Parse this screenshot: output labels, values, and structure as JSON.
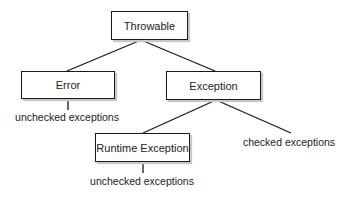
{
  "diagram": {
    "type": "class-hierarchy-tree",
    "nodes": [
      {
        "id": "throwable",
        "label": "Throwable"
      },
      {
        "id": "error",
        "label": "Error"
      },
      {
        "id": "exception",
        "label": "Exception"
      },
      {
        "id": "runtime",
        "label": "Runtime Exception"
      }
    ],
    "edges": [
      {
        "from": "throwable",
        "to": "error"
      },
      {
        "from": "throwable",
        "to": "exception"
      },
      {
        "from": "exception",
        "to": "runtime"
      },
      {
        "from": "exception",
        "to": "checked_label"
      },
      {
        "from": "error",
        "to": "error_unchecked_label"
      },
      {
        "from": "runtime",
        "to": "runtime_unchecked_label"
      }
    ],
    "annotations": {
      "error_unchecked": "unchecked exceptions",
      "checked": "checked exceptions",
      "runtime_unchecked": "unchecked exceptions"
    },
    "colors": {
      "line": "#1a1a1a",
      "box_border": "#1a1a1a",
      "box_shadow": "#c8c8c8",
      "text": "#222222",
      "background": "#ffffff"
    }
  }
}
